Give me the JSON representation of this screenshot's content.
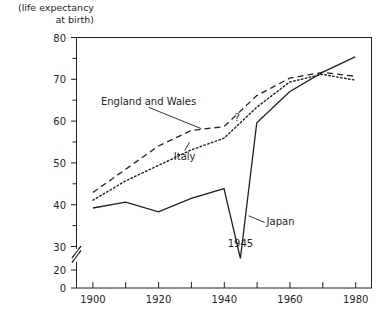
{
  "chart_data": {
    "type": "line",
    "title": "",
    "subtitle": "",
    "axis_caption": "(life expectancy\nat birth)",
    "xlabel": "",
    "ylabel": "",
    "xlim": [
      1895,
      1985
    ],
    "ylim": [
      20,
      80
    ],
    "y_axis_break": {
      "present": true,
      "between": [
        0,
        20
      ],
      "glyph": "double-slash"
    },
    "y_zero_shown": true,
    "grid": false,
    "legend_position": "inline-annotations",
    "x_ticks": [
      1900,
      1910,
      1920,
      1930,
      1940,
      1950,
      1960,
      1970,
      1980
    ],
    "x_tick_labels": [
      "1900",
      "",
      "1920",
      "",
      "1940",
      "",
      "1960",
      "",
      "1980"
    ],
    "y_ticks": [
      0,
      20,
      25,
      30,
      35,
      40,
      45,
      50,
      55,
      60,
      65,
      70,
      75,
      80
    ],
    "y_tick_labels": [
      "0",
      "20",
      "",
      "30",
      "",
      "40",
      "",
      "50",
      "",
      "60",
      "",
      "70",
      "",
      "80"
    ],
    "series": [
      {
        "name": "England and Wales",
        "style": "dashed",
        "color": "#231f20",
        "x": [
          1900,
          1910,
          1920,
          1930,
          1940,
          1950,
          1960,
          1970,
          1980
        ],
        "values": [
          40,
          46,
          52,
          56,
          57,
          65,
          69.5,
          71,
          70
        ]
      },
      {
        "name": "Italy",
        "style": "dotted",
        "color": "#231f20",
        "x": [
          1900,
          1910,
          1920,
          1930,
          1940,
          1950,
          1960,
          1970,
          1980
        ],
        "values": [
          38,
          43,
          47,
          51,
          54,
          62,
          68.5,
          70.5,
          69
        ],
        "gap_marker": {
          "label": "?",
          "x": 1944,
          "y": 58.5
        }
      },
      {
        "name": "Japan",
        "style": "solid",
        "color": "#231f20",
        "x": [
          1900,
          1910,
          1920,
          1930,
          1940,
          1945,
          1950,
          1960,
          1970,
          1980
        ],
        "values": [
          36,
          37.5,
          35,
          38.5,
          41,
          23,
          58,
          66,
          71,
          75
        ]
      }
    ],
    "annotations": [
      {
        "text": "England and Wales",
        "x": 1917,
        "y": 62.5,
        "leader_to": {
          "x": 1933,
          "y": 56.5
        }
      },
      {
        "text": "Italy",
        "x": 1928,
        "y": 48.5,
        "leader_to": {
          "x": 1929.5,
          "y": 53
        }
      },
      {
        "text": "Japan",
        "x": 1953,
        "y": 31.5,
        "leader_to": {
          "x": 1947.5,
          "y": 34
        }
      },
      {
        "text": "1945",
        "x": 1945,
        "y": 26,
        "leader_to": null
      }
    ]
  }
}
